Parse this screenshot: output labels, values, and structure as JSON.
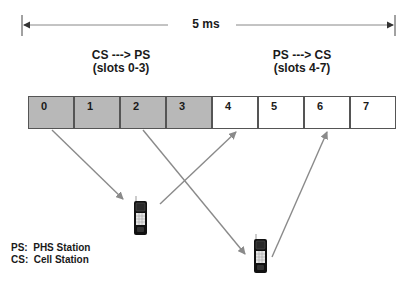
{
  "diagram": {
    "duration": {
      "label": "5 ms"
    },
    "directions": [
      {
        "title": "CS ---> PS",
        "subtitle": "(slots 0-3)"
      },
      {
        "title": "PS ---> CS",
        "subtitle": "(slots 4-7)"
      }
    ],
    "slots": [
      {
        "label": "0",
        "fill": "#b8b8b8"
      },
      {
        "label": "1",
        "fill": "#b8b8b8"
      },
      {
        "label": "2",
        "fill": "#b8b8b8"
      },
      {
        "label": "3",
        "fill": "#b8b8b8"
      },
      {
        "label": "4",
        "fill": "#ffffff"
      },
      {
        "label": "5",
        "fill": "#ffffff"
      },
      {
        "label": "6",
        "fill": "#ffffff"
      },
      {
        "label": "7",
        "fill": "#ffffff"
      }
    ],
    "handsets": [
      {
        "name": "PHS handset 1"
      },
      {
        "name": "PHS handset 2"
      }
    ],
    "legend": [
      "PS:  PHS Station",
      "CS:  Cell Station"
    ],
    "colors": {
      "tx_slot": "#b8b8b8",
      "rx_slot": "#ffffff",
      "arrow": "#8a8a8a",
      "line": "#555555"
    }
  }
}
